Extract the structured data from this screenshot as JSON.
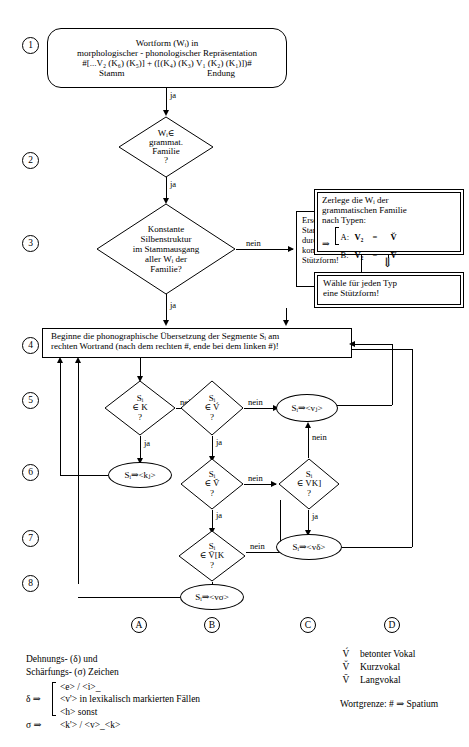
{
  "diagram": {
    "language": "de"
  },
  "steps": [
    {
      "number": "1"
    },
    {
      "number": "2"
    },
    {
      "number": "3"
    },
    {
      "number": "4"
    },
    {
      "number": "5"
    },
    {
      "number": "6"
    },
    {
      "number": "7"
    },
    {
      "number": "8"
    }
  ],
  "nodes": {
    "start": {
      "type": "rounded-box",
      "line1": "Wortform (Wᵢ) in",
      "line2": "morphologischer - phonologischer Repräsentation",
      "line3": "#[...V₂ (K₆) (K₅)] + ([(K₄) (K₃) V₁ (K₂) (K₁)])#",
      "line4_left": "Stamm",
      "line4_right": "Endung"
    },
    "d2": {
      "type": "diamond",
      "line1": "Wᵢ∈",
      "line2": "grammat.",
      "line3": "Familie",
      "line4": "?"
    },
    "d3": {
      "type": "diamond",
      "line1": "Konstante",
      "line2": "Silbenstruktur",
      "line3": "im Stammausgang",
      "line4": "aller Wᵢ der",
      "line5": "Familie?"
    },
    "ersetze": {
      "type": "box",
      "line1": "Ersetze den",
      "line2": "Stamm Wᵢ",
      "line3": "durch eine",
      "line4": "kompatible",
      "line5": "Stützform!"
    },
    "zerlege": {
      "type": "double-box",
      "line1": "Zerlege die Wᵢ der",
      "line2": "grammatischen Familie",
      "line3": "nach Typen:",
      "arrow": "⇒",
      "type_a_label": "A:",
      "type_a_lhs": "V₂",
      "type_a_eq": "=",
      "type_a_rhs": "V̆",
      "type_b_label": "B:",
      "type_b_lhs": "V₂",
      "type_b_eq": "=",
      "type_b_rhs": "V̄"
    },
    "down_arrow_between": "⇓",
    "waehle": {
      "type": "double-box",
      "line1": "Wähle für jeden Typ",
      "line2": "eine Stützform!"
    },
    "beginne": {
      "type": "box",
      "line1": "Beginne die phonographische Übersetzung der Segmente Sᵢ am",
      "line2": "rechten Wortrand (nach dem rechten #, ende bei dem linken #)!"
    },
    "d5a": {
      "type": "diamond",
      "line1": "Sᵢ",
      "line2": "∈ K",
      "line3": "?"
    },
    "d5b": {
      "type": "diamond",
      "line1": "Sᵢ",
      "line2": "∈ V́",
      "line3": "?"
    },
    "e5": {
      "type": "ellipse",
      "text": "Sᵢ⇒<vⱼ>"
    },
    "e6": {
      "type": "ellipse",
      "text": "Sᵢ⇒<kⱼ>"
    },
    "d6b": {
      "type": "diamond",
      "line1": "Sᵢ",
      "line2": "∈ V̆",
      "line3": "?"
    },
    "d6c": {
      "type": "diamond",
      "line1": "Sᵢ",
      "line2": "∈ VK]",
      "line3": "?"
    },
    "d7b": {
      "type": "diamond",
      "line1": "Sᵢ",
      "line2": "∈ V̄[K",
      "line3": "?"
    },
    "e7": {
      "type": "ellipse",
      "text": "Sᵢ⇒<vδ>"
    },
    "e8": {
      "type": "ellipse",
      "text": "Sᵢ⇒<vσ>"
    }
  },
  "edge_labels": {
    "ja": "ja",
    "nein": "nein"
  },
  "edges": [
    {
      "from": "start",
      "to": "d2",
      "label": "ja"
    },
    {
      "from": "d2",
      "to": "d3",
      "label": "ja"
    },
    {
      "from": "d3",
      "to": "ersetze",
      "label": "nein"
    },
    {
      "from": "d3",
      "to": "beginne",
      "label": "ja"
    },
    {
      "from": "ersetze",
      "to": "zerlege",
      "label": ""
    },
    {
      "from": "waehle",
      "to": "ersetze",
      "label": ""
    },
    {
      "from": "d5a",
      "to": "d5b",
      "label": "nein"
    },
    {
      "from": "d5a",
      "to": "e6",
      "label": "ja"
    },
    {
      "from": "d5b",
      "to": "e5",
      "label": "nein"
    },
    {
      "from": "d5b",
      "to": "d6b",
      "label": "ja"
    },
    {
      "from": "d6b",
      "to": "d6c",
      "label": "nein"
    },
    {
      "from": "d6b",
      "to": "d7b",
      "label": "ja"
    },
    {
      "from": "d6c",
      "to": "e5",
      "label": "nein"
    },
    {
      "from": "d6c",
      "to": "e7",
      "label": "ja"
    },
    {
      "from": "d7b",
      "to": "e7",
      "label": "nein"
    },
    {
      "from": "d7b",
      "to": "e8",
      "label": "ja"
    }
  ],
  "columns": [
    {
      "letter": "A"
    },
    {
      "letter": "B"
    },
    {
      "letter": "C"
    },
    {
      "letter": "D"
    }
  ],
  "legend_left": {
    "line1": "Dehnungs- (δ) und",
    "line2": "Schärfungs- (σ) Zeichen",
    "delta_symbol": "δ ⇒",
    "delta_items": [
      "<e> / <i>_",
      "<v'> in lexikalisch markierten Fällen",
      "<h> sonst"
    ],
    "sigma_symbol": "σ ⇒",
    "sigma_item": "<k'> / <v>_<k>"
  },
  "legend_right": {
    "rows": [
      {
        "symbol": "V́",
        "desc": "betonter Vokal"
      },
      {
        "symbol": "V̆",
        "desc": "Kurzvokal"
      },
      {
        "symbol": "V̄",
        "desc": "Langvokal"
      }
    ],
    "wortgrenze": "Wortgrenze: # ⇒ Spatium"
  },
  "colors": {
    "stroke": "#000000",
    "background": "#ffffff"
  }
}
